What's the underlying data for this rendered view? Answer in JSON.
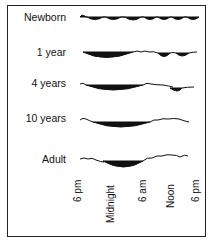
{
  "rows": [
    {
      "label": "Newborn"
    },
    {
      "label": "1 year"
    },
    {
      "label": "4 years"
    },
    {
      "label": "10 years"
    },
    {
      "label": "Adult"
    }
  ],
  "time_axis": [
    "6 pm",
    "Midnight",
    "6 am",
    "Noon",
    "6 pm"
  ],
  "colors": {
    "ink": "#111111",
    "border": "#222222",
    "background": "#ffffff"
  }
}
